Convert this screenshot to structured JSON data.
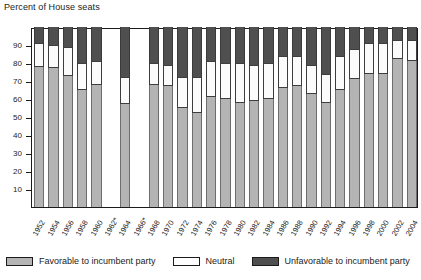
{
  "chart_data": {
    "type": "bar",
    "subtype": "stacked-column",
    "title": "Percent of House seats",
    "xlabel": "",
    "ylabel": "",
    "ylim": [
      0,
      100
    ],
    "yticks": [
      90,
      80,
      70,
      60,
      50,
      40,
      30,
      20,
      10
    ],
    "ytick_labels": [
      "90",
      "80",
      "70",
      "60",
      "50",
      "40",
      "30",
      "20",
      "10"
    ],
    "grid": false,
    "legend_position": "bottom",
    "note": "Bars for 1962* and 1966* are blank (no data available); asterisk marks those years.",
    "categories": [
      "1952",
      "1954",
      "1956",
      "1958",
      "1960",
      "1962*",
      "1964",
      "1966*",
      "1968",
      "1970",
      "1972",
      "1974",
      "1976",
      "1978",
      "1980",
      "1982",
      "1984",
      "1986",
      "1988",
      "1990",
      "1992",
      "1994",
      "1996",
      "1998",
      "2000",
      "2002",
      "2004"
    ],
    "series": [
      {
        "name": "Favorable to incumbent party",
        "color": "#b4b4b4",
        "values": [
          78,
          77,
          73,
          65,
          68,
          null,
          57,
          null,
          68,
          67,
          55,
          52,
          61,
          60,
          58,
          59,
          60,
          66,
          67,
          63,
          58,
          65,
          71,
          74,
          74,
          82,
          81
        ]
      },
      {
        "name": "Neutral",
        "color": "#ffffff",
        "values": [
          13,
          13,
          16,
          15,
          13,
          null,
          15,
          null,
          12,
          12,
          17,
          20,
          20,
          20,
          22,
          20,
          20,
          18,
          17,
          16,
          16,
          19,
          17,
          17,
          17,
          11,
          12
        ]
      },
      {
        "name": "Unfavorable to incumbent party",
        "color": "#4f4f4f",
        "values": [
          9,
          10,
          11,
          20,
          19,
          null,
          28,
          null,
          20,
          21,
          28,
          28,
          19,
          20,
          20,
          21,
          20,
          16,
          16,
          21,
          26,
          16,
          12,
          9,
          9,
          7,
          7
        ]
      }
    ]
  },
  "legend": {
    "items": [
      {
        "label": "Favorable to incumbent party",
        "swatch": "fav"
      },
      {
        "label": "Neutral",
        "swatch": "neu"
      },
      {
        "label": "Unfavorable to incumbent party",
        "swatch": "unf"
      }
    ]
  }
}
